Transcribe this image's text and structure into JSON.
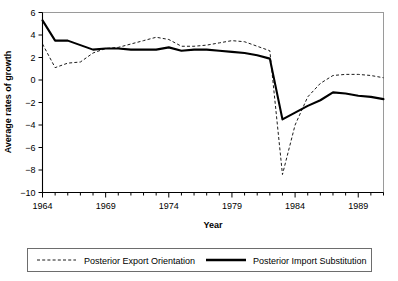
{
  "chart_data": {
    "type": "line",
    "title": "",
    "xlabel": "Year",
    "ylabel": "Average rates of growth",
    "xlim": [
      1964,
      1991
    ],
    "ylim": [
      -10,
      6
    ],
    "ytick_step": 2,
    "yticks": [
      6,
      4,
      2,
      0,
      -2,
      -4,
      -6,
      -8,
      -10
    ],
    "ytick_labels": [
      "6",
      "4",
      "2",
      "0",
      "-2",
      "-4",
      "-6",
      "-8",
      "-10"
    ],
    "xticks": [
      1964,
      1969,
      1974,
      1979,
      1984,
      1989
    ],
    "xtick_labels": [
      "1964",
      "1969",
      "1974",
      "1979",
      "1984",
      "1989"
    ],
    "xminor_step": 1,
    "grid": false,
    "legend_position": "bottom",
    "x": [
      1964,
      1965,
      1966,
      1967,
      1968,
      1969,
      1970,
      1971,
      1972,
      1973,
      1974,
      1975,
      1976,
      1977,
      1978,
      1979,
      1980,
      1981,
      1982,
      1983,
      1984,
      1985,
      1986,
      1987,
      1988,
      1989,
      1990,
      1991
    ],
    "series": [
      {
        "name": "Posterior Export Orientation",
        "style": "dashed",
        "color": "#000000",
        "values": [
          3.2,
          1.1,
          1.5,
          1.6,
          2.4,
          2.8,
          2.9,
          3.2,
          3.5,
          3.8,
          3.6,
          3.0,
          3.0,
          3.1,
          3.3,
          3.5,
          3.4,
          3.0,
          2.6,
          -8.4,
          -4.0,
          -1.5,
          -0.3,
          0.4,
          0.5,
          0.5,
          0.4,
          0.2
        ]
      },
      {
        "name": "Posterior Import Substitution",
        "style": "solid",
        "color": "#000000",
        "values": [
          5.3,
          3.5,
          3.5,
          3.1,
          2.7,
          2.8,
          2.8,
          2.7,
          2.7,
          2.7,
          2.9,
          2.6,
          2.7,
          2.7,
          2.6,
          2.5,
          2.4,
          2.2,
          1.9,
          -3.5,
          -2.9,
          -2.3,
          -1.8,
          -1.1,
          -1.2,
          -1.4,
          -1.5,
          -1.7
        ]
      }
    ]
  },
  "legend": {
    "entries": [
      {
        "label": "Posterior Export Orientation",
        "marker": "dashed-line-swatch"
      },
      {
        "label": "Posterior Import Substitution",
        "marker": "solid-line-swatch"
      }
    ]
  }
}
